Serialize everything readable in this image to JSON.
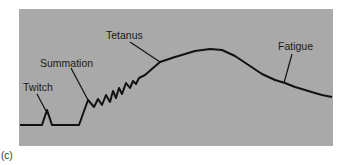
{
  "figure": {
    "panel_label": "(c)",
    "background_color": "#a9a9a9",
    "line_color": "#111111",
    "annotations": [
      {
        "id": "twitch",
        "text": "Twitch"
      },
      {
        "id": "summation",
        "text": "Summation"
      },
      {
        "id": "tetanus",
        "text": "Tetanus"
      },
      {
        "id": "fatigue",
        "text": "Fatigue"
      }
    ]
  }
}
